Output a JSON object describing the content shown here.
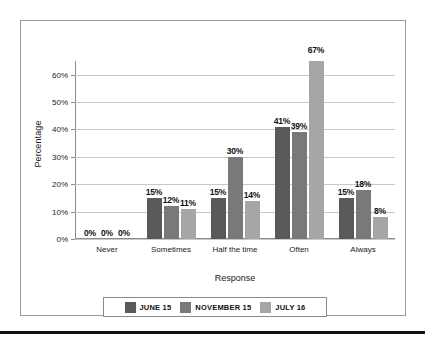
{
  "chart_data": {
    "type": "bar",
    "title": "",
    "xlabel": "Response",
    "ylabel": "Percentage",
    "categories": [
      "Never",
      "Sometimes",
      "Half the time",
      "Often",
      "Always"
    ],
    "series": [
      {
        "name": "JUNE 15",
        "color": "#5a5a5a",
        "values": [
          0,
          15,
          15,
          41,
          15
        ],
        "labels": [
          "0%",
          "15%",
          "15%",
          "41%",
          "15%"
        ]
      },
      {
        "name": "NOVEMBER 15",
        "color": "#797979",
        "values": [
          0,
          12,
          30,
          39,
          18
        ],
        "labels": [
          "0%",
          "12%",
          "30%",
          "39%",
          "18%"
        ]
      },
      {
        "name": "JULY 16",
        "color": "#a6a6a6",
        "values": [
          0,
          11,
          14,
          67,
          8
        ],
        "labels": [
          "0%",
          "11%",
          "14%",
          "67%",
          "8%"
        ]
      }
    ],
    "ylim": [
      0,
      65
    ],
    "yticks": [
      0,
      10,
      20,
      30,
      40,
      50,
      60
    ],
    "ytick_labels": [
      "0%",
      "10%",
      "20%",
      "30%",
      "40%",
      "50%",
      "60%"
    ],
    "grid": true,
    "legend_position": "bottom"
  },
  "colors": {
    "series_1": "#5a5a5a",
    "series_2": "#797979",
    "series_3": "#a6a6a6",
    "gridline": "#c8c8c8",
    "axis": "#8a8a8a",
    "frame": "#9a9a9a",
    "rule": "#111111"
  }
}
